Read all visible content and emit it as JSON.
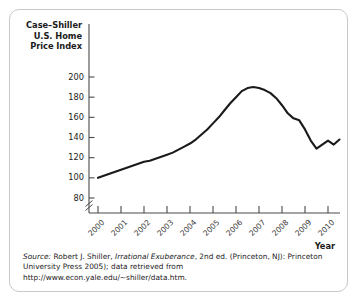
{
  "figure": {
    "y_axis_title": "Case–Shiller\nU.S. Home\nPrice Index",
    "x_axis_title": "Year",
    "caption": {
      "source_word": "Source:",
      "author": " Robert J. Shiller, ",
      "book_title": "Irrational Exuberance",
      "rest": ", 2nd ed. (Princeton, NJ): Princeton University Press 2005); data retrieved from http://www.econ.yale.edu/~shiller/data.htm."
    }
  },
  "chart_data": {
    "type": "line",
    "title": "",
    "xlabel": "Year",
    "ylabel": "Case–Shiller U.S. Home Price Index",
    "xlim": [
      2000,
      2010.5
    ],
    "ylim": [
      70,
      205
    ],
    "grid": false,
    "legend": "none",
    "axis_break": true,
    "y_ticks": [
      80,
      100,
      120,
      140,
      160,
      180,
      200
    ],
    "x_ticks": [
      "2000",
      "2001",
      "2002",
      "2003",
      "2004",
      "2005",
      "2006",
      "2007",
      "2008",
      "2009",
      "2010"
    ],
    "series": [
      {
        "name": "Case-Shiller U.S. Home Price Index",
        "color": "#1a1a1a",
        "x": [
          2000.0,
          2000.25,
          2000.5,
          2000.75,
          2001.0,
          2001.25,
          2001.5,
          2001.75,
          2002.0,
          2002.25,
          2002.5,
          2002.75,
          2003.0,
          2003.25,
          2003.5,
          2003.75,
          2004.0,
          2004.25,
          2004.5,
          2004.75,
          2005.0,
          2005.25,
          2005.5,
          2005.75,
          2006.0,
          2006.25,
          2006.5,
          2006.75,
          2007.0,
          2007.25,
          2007.5,
          2007.75,
          2008.0,
          2008.25,
          2008.5,
          2008.75,
          2009.0,
          2009.25,
          2009.5,
          2009.75,
          2010.0,
          2010.25,
          2010.5
        ],
        "values": [
          100,
          102,
          104,
          106,
          108,
          110,
          112,
          114,
          116,
          117,
          119,
          121,
          123,
          125,
          128,
          131,
          134,
          138,
          143,
          148,
          154,
          160,
          167,
          174,
          180,
          186,
          189,
          190,
          189,
          187,
          184,
          179,
          172,
          164,
          159,
          157,
          148,
          137,
          129,
          133,
          137,
          133,
          138
        ]
      }
    ]
  }
}
